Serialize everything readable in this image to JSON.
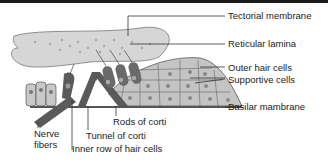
{
  "colors": {
    "membrane_fill": "#d6d6d6",
    "cell_fill": "#bdbdbd",
    "dark_structure": "#5a5a5a",
    "line": "#333333",
    "top_bar": "#1a1a1a"
  },
  "labels": {
    "tectorial_membrane": "Tectorial membrane",
    "reticular_lamina": "Reticular lamina",
    "outer_hair_cells": "Outer hair cells",
    "supportive_cells": "Supportive cells",
    "basilar_membrane": "Basilar mambrane",
    "nerve_fibers_line1": "Nerve",
    "nerve_fibers_line2": "fibers",
    "rods_of_corti": "Rods of corti",
    "tunnel_of_corti": "Tunnel of corti",
    "inner_row_hair_cells": "Inner row of hair cells"
  }
}
